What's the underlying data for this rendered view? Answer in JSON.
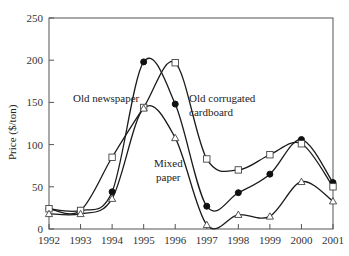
{
  "chart_data": {
    "type": "line",
    "title": "",
    "xlabel": "",
    "ylabel": "Price ($/ton)",
    "x": [
      1992,
      1993,
      1994,
      1995,
      1996,
      1997,
      1998,
      1999,
      2000,
      2001
    ],
    "xticks": [
      "1992",
      "1993",
      "1994",
      "1995",
      "1996",
      "1997",
      "1998",
      "1999",
      "2000",
      "2001"
    ],
    "yticks": [
      "0",
      "50",
      "100",
      "150",
      "200",
      "250"
    ],
    "ylim": [
      0,
      250
    ],
    "xlim": [
      1992,
      2001
    ],
    "grid": false,
    "legend": "inline annotations",
    "series": [
      {
        "name": "Old newspaper",
        "marker": "filled-circle",
        "values": [
          24,
          22,
          44,
          198,
          148,
          27,
          43,
          65,
          106,
          55
        ]
      },
      {
        "name": "Old corrugated cardboard",
        "marker": "open-square",
        "values": [
          24,
          22,
          85,
          144,
          197,
          83,
          70,
          88,
          101,
          50
        ]
      },
      {
        "name": "Mixed paper",
        "marker": "open-triangle",
        "values": [
          18,
          18,
          36,
          143,
          108,
          5,
          17,
          15,
          56,
          33
        ]
      }
    ],
    "annotations": [
      {
        "text": "Old newspaper",
        "x": 73,
        "y": 102
      },
      {
        "text": "Old corrugated",
        "x": 189,
        "y": 102
      },
      {
        "text": "cardboard",
        "x": 189,
        "y": 116
      },
      {
        "text": "Mixed",
        "x": 154,
        "y": 167
      },
      {
        "text": "paper",
        "x": 156,
        "y": 181
      }
    ]
  },
  "labels": {
    "ylabel": "Price ($/ton)",
    "ann_newspaper": "Old newspaper",
    "ann_cardboard_1": "Old corrugated",
    "ann_cardboard_2": "cardboard",
    "ann_mixed_1": "Mixed",
    "ann_mixed_2": "paper"
  }
}
